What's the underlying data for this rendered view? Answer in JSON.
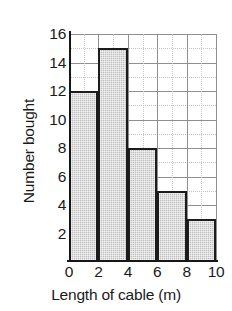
{
  "chart_data": {
    "type": "bar",
    "title": "",
    "subtitle": "",
    "xlabel": "Length of cable (m)",
    "ylabel": "Number bought",
    "categories": [
      "0-2",
      "2-4",
      "4-6",
      "6-8",
      "8-10"
    ],
    "bin_edges": [
      0,
      2,
      4,
      6,
      8,
      10
    ],
    "values": [
      12,
      15,
      8,
      5,
      3
    ],
    "xlim": [
      0,
      10
    ],
    "ylim": [
      0,
      16
    ],
    "x_ticks": [
      "0",
      "2",
      "4",
      "6",
      "8",
      "10"
    ],
    "x_tick_values": [
      0,
      2,
      4,
      6,
      8,
      10
    ],
    "y_ticks": [
      "2",
      "4",
      "6",
      "8",
      "10",
      "12",
      "14",
      "16"
    ],
    "y_tick_values": [
      2,
      4,
      6,
      8,
      10,
      12,
      14,
      16
    ],
    "grid": true,
    "grid_major_y": [
      2,
      4,
      6,
      8,
      10,
      12,
      14,
      16
    ],
    "grid_minor_y": [
      1,
      3,
      5,
      7,
      9,
      11,
      13,
      15
    ],
    "grid_major_x": [
      0,
      2,
      4,
      6,
      8,
      10
    ],
    "grid_minor_x": [
      1,
      3,
      5,
      7,
      9
    ],
    "legend": null,
    "legend_position": "none",
    "annotations": [],
    "bar_fill_color": "#bdbdbd",
    "bar_edge_color": "#1c1c1c",
    "grid_color": "#8f8f8f",
    "axis_color": "#161616",
    "background_color": "#ffffff",
    "text_color": "#1a1a1a"
  }
}
